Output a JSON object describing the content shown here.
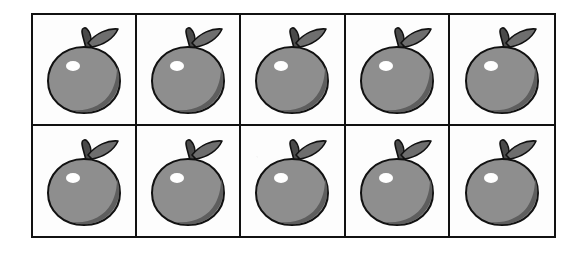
{
  "page": {
    "background_color": "#ffffff"
  },
  "grid": {
    "columns": 5,
    "rows": 2,
    "total_cells": 10,
    "border_color": "#111111",
    "cell_background": "#fdfdfd",
    "cells": [
      {
        "index": 1,
        "row": 1,
        "column": 1,
        "item": "apple"
      },
      {
        "index": 2,
        "row": 1,
        "column": 2,
        "item": "apple"
      },
      {
        "index": 3,
        "row": 1,
        "column": 3,
        "item": "apple"
      },
      {
        "index": 4,
        "row": 1,
        "column": 4,
        "item": "apple"
      },
      {
        "index": 5,
        "row": 1,
        "column": 5,
        "item": "apple"
      },
      {
        "index": 6,
        "row": 2,
        "column": 1,
        "item": "apple"
      },
      {
        "index": 7,
        "row": 2,
        "column": 2,
        "item": "apple"
      },
      {
        "index": 8,
        "row": 2,
        "column": 3,
        "item": "apple"
      },
      {
        "index": 9,
        "row": 2,
        "column": 4,
        "item": "apple"
      },
      {
        "index": 10,
        "row": 2,
        "column": 5,
        "item": "apple"
      }
    ]
  },
  "apple": {
    "icon_name": "apple-icon",
    "body_color": "#8e8e8e",
    "body_shadow_color": "#5e5e5e",
    "outline_color": "#111111",
    "stem_color": "#4a4a4a",
    "leaf_color": "#6e6e6e",
    "highlight_color": "#ffffff",
    "count": 10
  }
}
